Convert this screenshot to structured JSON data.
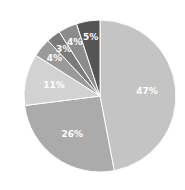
{
  "chart_data": {
    "type": "pie",
    "title": "",
    "start_angle": "12 o'clock",
    "direction": "clockwise",
    "slices": [
      {
        "label": "47%",
        "value": 47,
        "color": "#c4c4c4"
      },
      {
        "label": "26%",
        "value": 26,
        "color": "#ababab"
      },
      {
        "label": "11%",
        "value": 11,
        "color": "#d2d2d2"
      },
      {
        "label": "4%",
        "value": 4,
        "color": "#9a9a9a"
      },
      {
        "label": "3%",
        "value": 3,
        "color": "#7a7a7a"
      },
      {
        "label": "4%",
        "value": 4,
        "color": "#8c8c8c"
      },
      {
        "label": "5%",
        "value": 5,
        "color": "#555555"
      }
    ],
    "legend": "none"
  }
}
